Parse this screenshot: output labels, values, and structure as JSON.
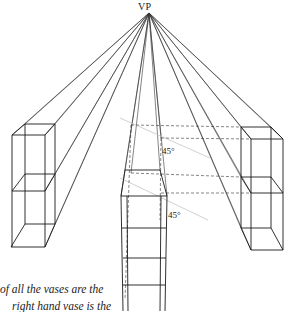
{
  "figure": {
    "vanishing_point_label": "VP",
    "angle_labels": [
      "45°",
      "45°"
    ],
    "caption_lines": [
      "of all the vases are the",
      "right hand vase is the"
    ],
    "colors": {
      "line": "#1a1a1a",
      "construction": "#555555",
      "diagonal": "#bbbbbb"
    },
    "objects": [
      {
        "name": "left-vase",
        "type": "box-in-perspective"
      },
      {
        "name": "center-vase",
        "type": "box-in-perspective"
      },
      {
        "name": "right-vase",
        "type": "box-in-perspective"
      }
    ]
  }
}
